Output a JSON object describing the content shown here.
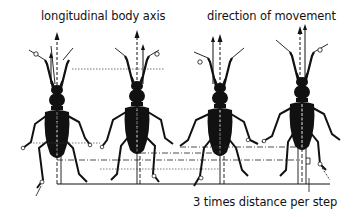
{
  "figure": {
    "type": "scientific-diagram",
    "labels": {
      "top_left": "longitudinal body axis",
      "top_right": "direction of movement",
      "bottom": "3 times distance per step"
    },
    "beetles": [
      {
        "index": 1,
        "center_x": 57
      },
      {
        "index": 2,
        "center_x": 137
      },
      {
        "index": 3,
        "center_x": 220
      },
      {
        "index": 4,
        "center_x": 302
      }
    ],
    "colors": {
      "ink": "#111111",
      "background": "#ffffff"
    }
  }
}
